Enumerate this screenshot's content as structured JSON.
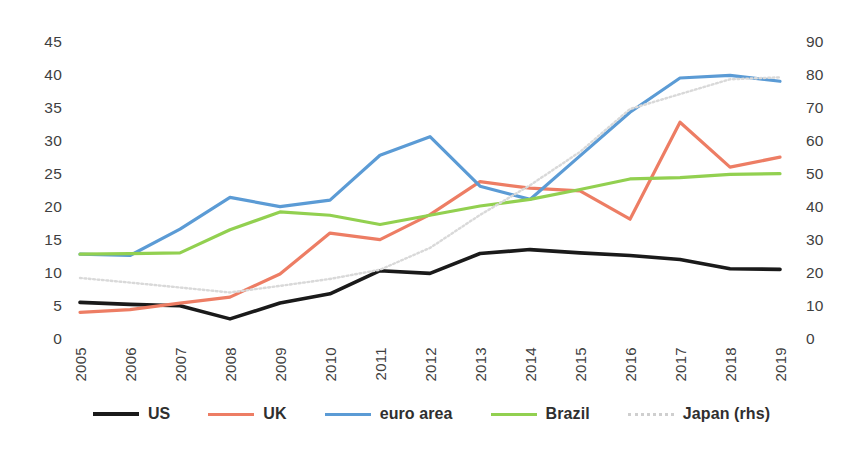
{
  "chart_data": {
    "type": "line",
    "title": "",
    "subtitle": "",
    "xlabel": "",
    "ylabel": "",
    "categories": [
      "2005",
      "2006",
      "2007",
      "2008",
      "2009",
      "2010",
      "2011",
      "2012",
      "2013",
      "2014",
      "2015",
      "2016",
      "2017",
      "2018",
      "2019"
    ],
    "ylim": [
      0,
      45
    ],
    "yticks": [
      0,
      5,
      10,
      15,
      20,
      25,
      30,
      35,
      40,
      45
    ],
    "y2lim": [
      0,
      90
    ],
    "y2ticks": [
      0,
      10,
      20,
      30,
      40,
      50,
      60,
      70,
      80,
      90
    ],
    "grid": false,
    "legend_position": "bottom",
    "series": [
      {
        "name": "US",
        "axis": "left",
        "color": "#1a1a1a",
        "style": "solid",
        "width": 3.6,
        "values": [
          5.7,
          5.4,
          5.2,
          3.2,
          5.6,
          7.0,
          10.5,
          10.1,
          13.1,
          13.7,
          13.2,
          12.8,
          12.2,
          10.8,
          10.7
        ]
      },
      {
        "name": "UK",
        "axis": "left",
        "color": "#ED7D64",
        "style": "solid",
        "width": 3.2,
        "values": [
          4.2,
          4.6,
          5.6,
          6.5,
          10.0,
          16.2,
          15.2,
          19.0,
          24.0,
          23.0,
          22.6,
          18.3,
          33.0,
          26.2,
          27.7
        ]
      },
      {
        "name": "euro area",
        "axis": "left",
        "color": "#5B9BD5",
        "style": "solid",
        "width": 3.2,
        "values": [
          13.0,
          12.8,
          16.8,
          21.6,
          20.2,
          21.2,
          28.0,
          30.8,
          23.3,
          21.3,
          27.9,
          34.5,
          39.7,
          40.1,
          39.2
        ]
      },
      {
        "name": "Brazil",
        "axis": "left",
        "color": "#92D050",
        "style": "solid",
        "width": 3.2,
        "values": [
          13.0,
          13.1,
          13.2,
          16.7,
          19.4,
          18.9,
          17.5,
          18.9,
          20.3,
          21.3,
          22.8,
          24.4,
          24.6,
          25.1,
          25.2
        ]
      },
      {
        "name": "Japan (rhs)",
        "axis": "right",
        "color": "#D9D9D9",
        "style": "dotted",
        "width": 2.4,
        "values": [
          18.8,
          17.4,
          15.9,
          14.4,
          16.4,
          18.5,
          21.3,
          27.9,
          37.9,
          46.9,
          57.0,
          70.0,
          74.5,
          79.0,
          79.6
        ]
      }
    ]
  },
  "legend": {
    "items": [
      {
        "label": "US",
        "color": "#1a1a1a",
        "style": "solid",
        "thickness": "4px"
      },
      {
        "label": "UK",
        "color": "#ED7D64",
        "style": "solid",
        "thickness": "3.5px"
      },
      {
        "label": "euro area",
        "color": "#5B9BD5",
        "style": "solid",
        "thickness": "3.5px"
      },
      {
        "label": "Brazil",
        "color": "#92D050",
        "style": "solid",
        "thickness": "3.5px"
      },
      {
        "label": "Japan (rhs)",
        "color": "#CFCFCF",
        "style": "dotted",
        "thickness": "3px"
      }
    ]
  }
}
